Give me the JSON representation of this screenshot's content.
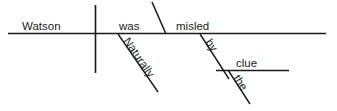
{
  "diagram": {
    "type": "reed-kellogg-sentence-diagram",
    "sentence": "Naturally Watson was misled by the clue.",
    "ink_color": "#1a1a1a",
    "background_color": "#ffffff",
    "words": {
      "subject": "Watson",
      "verb": "was",
      "predicate_complement": "misled",
      "adverb": "Naturally",
      "preposition": "by",
      "article": "the",
      "object_of_preposition": "clue"
    },
    "labels": {
      "subject": "Watson",
      "verb": "was",
      "complement": "misled",
      "adverb": "Naturally",
      "preposition": "by",
      "article": "the",
      "prep_object": "clue"
    }
  }
}
